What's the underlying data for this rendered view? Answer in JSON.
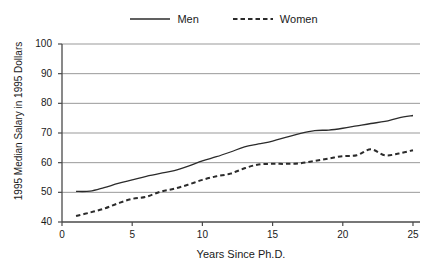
{
  "chart_data": {
    "type": "line",
    "title": "",
    "xlabel": "Years Since Ph.D.",
    "ylabel": "1995 Median Salary in 1995 Dollars",
    "xlim": [
      0,
      25.5
    ],
    "ylim": [
      40,
      100
    ],
    "xticks": [
      0,
      5,
      10,
      15,
      20,
      25
    ],
    "yticks": [
      40,
      50,
      60,
      70,
      80,
      90,
      100
    ],
    "xtick_labels": [
      "0",
      "5",
      "10",
      "15",
      "20",
      "25"
    ],
    "ytick_labels": [
      "40",
      "50",
      "60",
      "70",
      "80",
      "90",
      "100"
    ],
    "grid": "horizontal",
    "legend_position": "top-center",
    "series": [
      {
        "name": "Men",
        "style": "solid",
        "color": "#2b2b2b",
        "x": [
          1,
          2,
          3,
          4,
          5,
          6,
          7,
          8,
          9,
          10,
          11,
          12,
          13,
          14,
          15,
          16,
          17,
          18,
          19,
          20,
          21,
          22,
          23,
          24,
          25
        ],
        "values": [
          50.3,
          50.4,
          51.6,
          53.0,
          54.2,
          55.4,
          56.4,
          57.3,
          58.8,
          60.6,
          62.0,
          63.6,
          65.3,
          66.3,
          67.3,
          68.6,
          69.9,
          70.8,
          71.0,
          71.6,
          72.4,
          73.2,
          73.9,
          75.1,
          75.9
        ]
      },
      {
        "name": "Women",
        "style": "dashed",
        "color": "#2b2b2b",
        "x": [
          1,
          2,
          3,
          4,
          5,
          6,
          7,
          8,
          9,
          10,
          11,
          12,
          13,
          14,
          15,
          16,
          17,
          18,
          19,
          20,
          21,
          22,
          23,
          24,
          25
        ],
        "values": [
          42.0,
          43.2,
          44.5,
          46.3,
          47.8,
          48.5,
          50.2,
          51.2,
          52.6,
          54.2,
          55.4,
          56.3,
          58.1,
          59.4,
          59.6,
          59.6,
          59.8,
          60.6,
          61.4,
          62.2,
          62.5,
          64.5,
          62.5,
          63.1,
          64.2
        ]
      }
    ]
  },
  "legend": {
    "entries": [
      {
        "label": "Men"
      },
      {
        "label": "Women"
      }
    ]
  }
}
